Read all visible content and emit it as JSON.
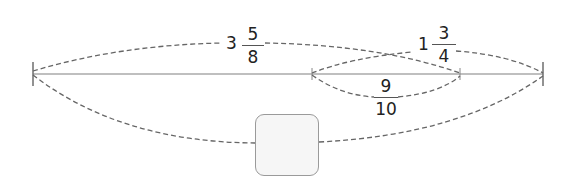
{
  "diagram": {
    "type": "number-line-segment-diagram",
    "colors": {
      "line": "#aaaaaa",
      "tick": "#777777",
      "dashed_arc": "#666666",
      "text": "#222222",
      "box_fill": "#f6f6f6",
      "box_border": "#9a9a9a"
    },
    "labels": {
      "total_whole": {
        "whole": "3",
        "numerator": "5",
        "denominator": "8"
      },
      "right_part": {
        "whole": "1",
        "numerator": "3",
        "denominator": "4"
      },
      "overlap": {
        "numerator": "9",
        "denominator": "10"
      }
    },
    "answer_box": {
      "value": ""
    }
  }
}
